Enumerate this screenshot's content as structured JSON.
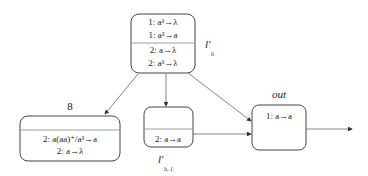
{
  "membranes": {
    "top": {
      "label": "l′",
      "label_sub": "h",
      "rules": [
        "1: a³→λ",
        "1: a³→a",
        "2: a→λ",
        "2: a³→λ"
      ]
    },
    "left": {
      "label": "8",
      "rules": [
        "2: a(aa)⁺/a³→a",
        "2: a→λ"
      ]
    },
    "middle": {
      "label": "l′",
      "label_sub": "h, 1",
      "rules": [
        "2: a→a"
      ]
    },
    "right": {
      "label": "out",
      "rules": [
        "1: a→a"
      ]
    }
  }
}
